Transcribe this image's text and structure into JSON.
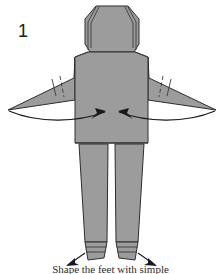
{
  "figure": {
    "step_number": "1",
    "caption": "Shape the feet with simple",
    "colors": {
      "background": "#ffffff",
      "paper_fill": "#9c9c9c",
      "paper_fill_shadow": "#8f8f8f",
      "outline": "#2e2e2e",
      "crease": "#3a3a3a",
      "arrow": "#1a1a1a"
    },
    "parts": [
      {
        "name": "head",
        "label": "head"
      },
      {
        "name": "torso",
        "label": "torso"
      },
      {
        "name": "left-arm",
        "label": "left arm"
      },
      {
        "name": "right-arm",
        "label": "right arm"
      },
      {
        "name": "left-leg",
        "label": "left leg"
      },
      {
        "name": "right-leg",
        "label": "right leg"
      },
      {
        "name": "left-foot",
        "label": "left foot"
      },
      {
        "name": "right-foot",
        "label": "right foot"
      }
    ],
    "annotations": [
      {
        "name": "left-arm-fold-arrow",
        "type": "curved-arrow",
        "direction": "inward-right"
      },
      {
        "name": "right-arm-fold-arrow",
        "type": "curved-arrow",
        "direction": "inward-left"
      },
      {
        "name": "left-foot-arrow",
        "type": "straight-arrow",
        "direction": "outward-left"
      },
      {
        "name": "right-foot-arrow",
        "type": "straight-arrow",
        "direction": "outward-right"
      }
    ]
  }
}
